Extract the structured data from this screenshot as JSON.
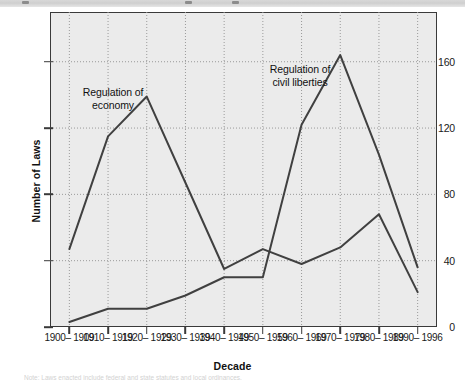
{
  "figure": {
    "title_bar_present": true,
    "footnote": "Note: Laws enacted include federal and state statutes and local ordinances."
  },
  "axes": {
    "y_title": "Number of Laws",
    "x_title": "Decade",
    "y_ticks": [
      0,
      40,
      80,
      120,
      160
    ],
    "y_tick_labels": [
      "0",
      "40",
      "80",
      "120",
      "160"
    ],
    "x_tick_labels": [
      "1900–\n1909",
      "1910–\n1919",
      "1920–\n1929",
      "1930–\n1939",
      "1940–\n1949",
      "1950–\n1959",
      "1960–\n1969",
      "1970–\n1979",
      "1980–\n1989",
      "1990–\n1996"
    ]
  },
  "annotations": [
    {
      "text": "Regulation of\neconomy",
      "x": 113,
      "y": 86
    },
    {
      "text": "Regulation of\ncivil liberties",
      "x": 300,
      "y": 63
    }
  ],
  "colors": {
    "plot_background": "#ebebeb",
    "axis": "#3a3a3a",
    "grid": "#9a9a9a",
    "line_economy": "#404040",
    "line_civil_liberties": "#404040",
    "page_background": "#ffffff"
  },
  "chart_data": {
    "type": "line",
    "title": "",
    "xlabel": "Decade",
    "ylabel": "Number of Laws",
    "categories": [
      "1900–1909",
      "1910–1919",
      "1920–1929",
      "1930–1939",
      "1940–1949",
      "1950–1959",
      "1960–1969",
      "1970–1979",
      "1980–1989",
      "1990–1996"
    ],
    "series": [
      {
        "name": "Regulation of economy",
        "values": [
          47,
          115,
          139,
          87,
          35,
          47,
          38,
          48,
          68,
          21
        ]
      },
      {
        "name": "Regulation of civil liberties",
        "values": [
          3,
          11,
          11,
          19,
          30,
          30,
          122,
          164,
          104,
          36
        ]
      }
    ],
    "ylim": [
      0,
      190
    ],
    "xlim": [
      0,
      9
    ],
    "grid": true,
    "grid_style": "dotted",
    "legend": "none (inline annotations)"
  }
}
